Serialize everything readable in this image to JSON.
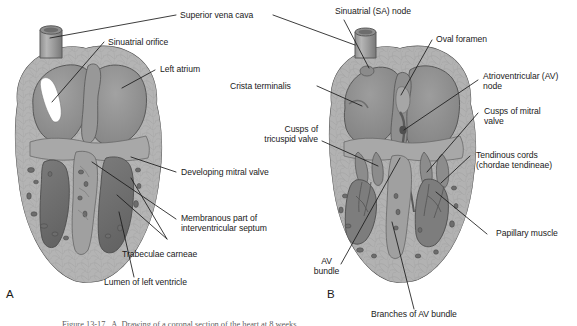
{
  "figure": {
    "width": 577,
    "height": 326,
    "background": "#ffffff",
    "line_color": "#1a1a1a",
    "text_color": "#1a1a1a",
    "tissue_colors": {
      "myocardium_light": "#b9b9b9",
      "myocardium_mid": "#a3a3a3",
      "endocardium_dark": "#8a8a8a",
      "cavity_dark": "#6f6f6f",
      "cavity_darker": "#5d5d5d",
      "vessel_gray": "#9a9a9a",
      "highlight_white": "#ffffff",
      "outline": "#4a4a4a"
    }
  },
  "panels": [
    {
      "id": "A",
      "letter": "A"
    },
    {
      "id": "B",
      "letter": "B"
    }
  ],
  "labels_panel_a": [
    {
      "id": "superior-vena-cava",
      "text": "Superior vena cava"
    },
    {
      "id": "sinuatrial-orifice",
      "text": "Sinuatrial orifice"
    },
    {
      "id": "left-atrium",
      "text": "Left atrium"
    },
    {
      "id": "developing-mitral-valve",
      "text": "Developing mitral valve"
    },
    {
      "id": "membranous-part-interventricular-septum",
      "line1": "Membranous part of",
      "line2": "interventricular septum"
    },
    {
      "id": "trabeculae-carneae",
      "text": "Trabeculae carneae"
    },
    {
      "id": "lumen-of-left-ventricle",
      "text": "Lumen of left ventricle"
    }
  ],
  "labels_panel_b": [
    {
      "id": "sinuatrial-sa-node",
      "text": "Sinuatrial (SA) node"
    },
    {
      "id": "oval-foramen",
      "text": "Oval foramen"
    },
    {
      "id": "crista-terminalis",
      "text": "Crista terminalis"
    },
    {
      "id": "cusps-of-tricuspid-valve",
      "line1": "Cusps of",
      "line2": "tricuspid valve"
    },
    {
      "id": "atrioventricular-av-node",
      "line1": "Atrioventricular (AV)",
      "line2": "node"
    },
    {
      "id": "cusps-of-mitral-valve",
      "line1": "Cusps of mitral",
      "line2": "valve"
    },
    {
      "id": "tendinous-cords",
      "line1": "Tendinous cords",
      "line2": "(chordae tendineae)"
    },
    {
      "id": "papillary-muscle",
      "text": "Papillary muscle"
    },
    {
      "id": "av-bundle",
      "line1": "AV",
      "line2": "bundle"
    },
    {
      "id": "branches-of-av-bundle",
      "text": "Branches of AV bundle"
    }
  ],
  "caption": {
    "text": "Figure 13-17   A, Drawing of a coronal section of the heart at 8 weeks"
  }
}
